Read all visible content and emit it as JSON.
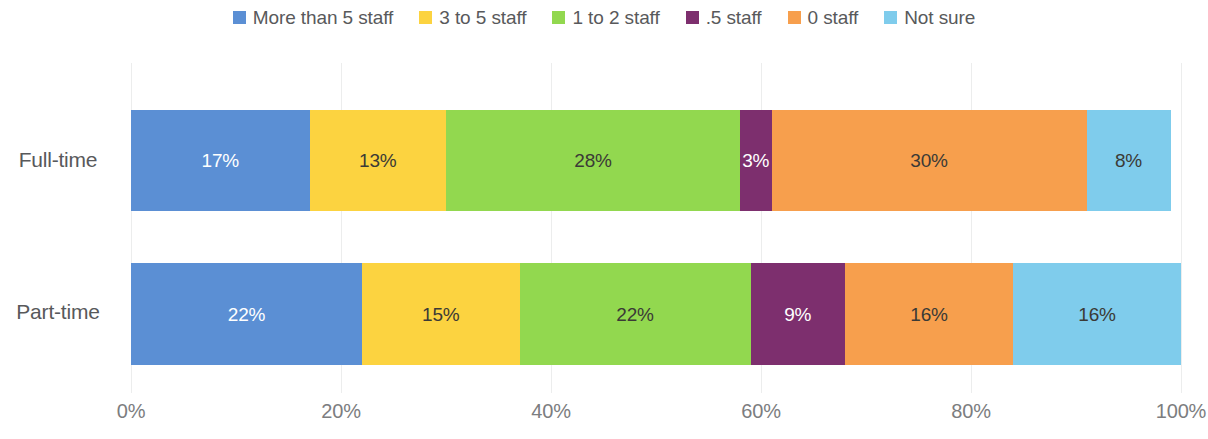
{
  "chart_data": {
    "type": "bar",
    "orientation": "horizontal",
    "stacked": true,
    "normalized": "100%",
    "title": "",
    "subtitle": "",
    "xlabel": "",
    "ylabel": "",
    "xlim": [
      0,
      100
    ],
    "x_ticks": [
      "0%",
      "20%",
      "40%",
      "60%",
      "80%",
      "100%"
    ],
    "x_tick_values": [
      0,
      20,
      40,
      60,
      80,
      100
    ],
    "grid": true,
    "grid_axis": "x",
    "legend_position": "top",
    "categories": [
      "Full-time",
      "Part-time"
    ],
    "series": [
      {
        "name": "More than 5 staff",
        "color": "#5b8fd4",
        "label_color": "light",
        "values": [
          17,
          22
        ],
        "labels": [
          "17%",
          "22%"
        ]
      },
      {
        "name": "3 to 5 staff",
        "color": "#fcd340",
        "label_color": "dark",
        "values": [
          13,
          15
        ],
        "labels": [
          "13%",
          "15%"
        ]
      },
      {
        "name": "1 to 2 staff",
        "color": "#92d84f",
        "label_color": "dark",
        "values": [
          28,
          22
        ],
        "labels": [
          "28%",
          "22%"
        ]
      },
      {
        "name": ".5 staff",
        "color": "#7d2f6e",
        "label_color": "light",
        "values": [
          3,
          9
        ],
        "labels": [
          "3%",
          "9%"
        ]
      },
      {
        "name": "0 staff",
        "color": "#f79f4d",
        "label_color": "dark",
        "values": [
          30,
          16
        ],
        "labels": [
          "30%",
          "16%"
        ]
      },
      {
        "name": "Not sure",
        "color": "#7fccec",
        "label_color": "dark",
        "values": [
          8,
          16
        ],
        "labels": [
          "8%",
          "16%"
        ]
      }
    ]
  },
  "legend": {
    "items": [
      {
        "label": "More than 5 staff",
        "color": "#5b8fd4"
      },
      {
        "label": "3 to 5 staff",
        "color": "#fcd340"
      },
      {
        "label": "1 to 2 staff",
        "color": "#92d84f"
      },
      {
        "label": ".5 staff",
        "color": "#7d2f6e"
      },
      {
        "label": "0 staff",
        "color": "#f79f4d"
      },
      {
        "label": "Not sure",
        "color": "#7fccec"
      }
    ]
  },
  "axis": {
    "x_ticks": [
      "0%",
      "20%",
      "40%",
      "60%",
      "80%",
      "100%"
    ]
  },
  "categories": {
    "labels": [
      "Full-time",
      "Part-time"
    ]
  }
}
